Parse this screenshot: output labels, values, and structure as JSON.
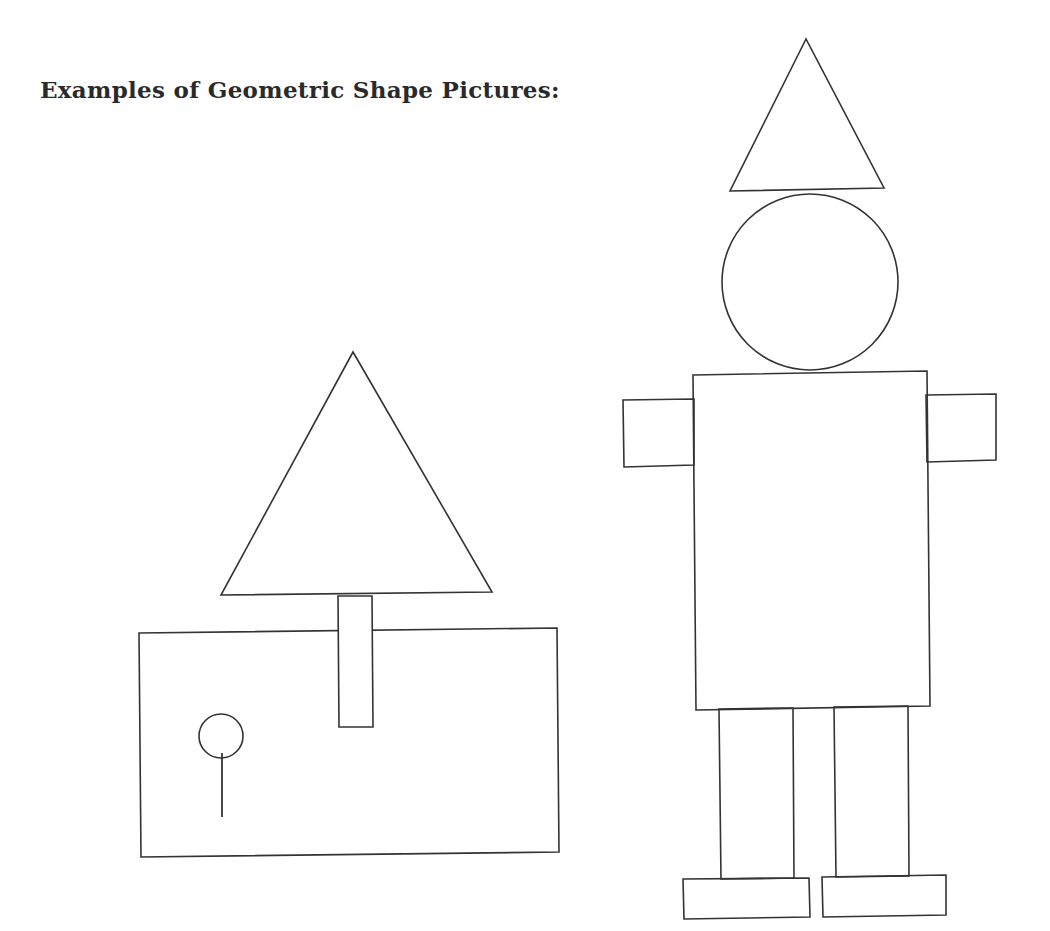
{
  "heading": "Examples of Geometric Shape Pictures:",
  "colors": {
    "background": "#ffffff",
    "stroke": "#333333",
    "text": "#2a2a2a"
  },
  "pictures": [
    {
      "name": "house-tree-picture",
      "shapes": {
        "tree_top_triangle": {
          "points": "353,352 221,595 492,592"
        },
        "tree_trunk_rectangle": {
          "points": "338,596 372,596 373,727 339,727"
        },
        "ground_rectangle": {
          "points": "139,633 557,628 559,852 141,857"
        },
        "flowers": [
          {
            "cx": 221,
            "cy": 736,
            "r": 22,
            "stem": {
              "x1": 222,
              "y1": 753,
              "x2": 222,
              "y2": 817
            }
          },
          {
            "cx": 404,
            "cy": 774,
            "r": 22,
            "stem": {
              "x1": 404,
              "y1": 795,
              "x2": 404,
              "y2": 818
            }
          },
          {
            "cx": 494,
            "cy": 689,
            "r": 23,
            "stem": {
              "x1": 497,
              "y1": 711,
              "x2": 497,
              "y2": 765
            }
          }
        ]
      }
    },
    {
      "name": "robot-person-picture",
      "shapes": {
        "hat_triangle": {
          "points": "806,39 730,191 884,188"
        },
        "head_circle": {
          "cx": 810,
          "cy": 282,
          "r": 88
        },
        "body_rectangle": {
          "points": "693,375 927,371 930,706 696,710"
        },
        "left_arm_rectangle": {
          "points": "623,400 694,399 694,465 624,467"
        },
        "right_arm_rectangle": {
          "points": "926,395 996,394 996,460 927,462"
        },
        "left_leg_rectangle": {
          "points": "719,709 793,708 794,878 721,879"
        },
        "right_leg_rectangle": {
          "points": "834,707 908,706 909,876 836,877"
        },
        "left_foot_rectangle": {
          "points": "683,879 809,878 810,917 684,919"
        },
        "right_foot_rectangle": {
          "points": "822,877 946,875 946,915 823,917"
        }
      }
    }
  ]
}
